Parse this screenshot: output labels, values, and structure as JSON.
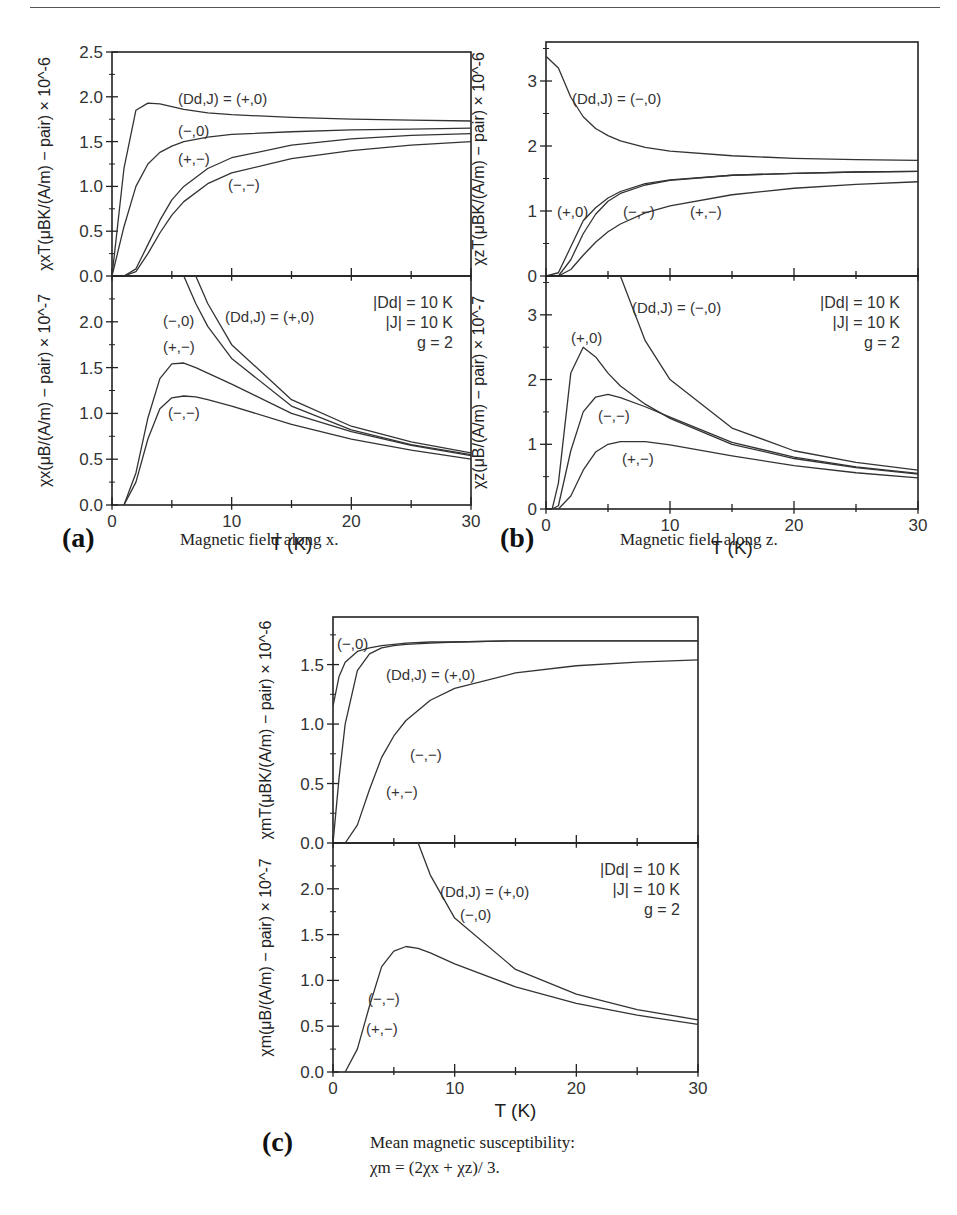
{
  "figure": {
    "panels": [
      {
        "id": "a",
        "label": "(a)",
        "caption": "Magnetic field along x."
      },
      {
        "id": "b",
        "label": "(b)",
        "caption": "Magnetic field along z."
      },
      {
        "id": "c",
        "label": "(c)",
        "caption": "Mean magnetic susceptibility:",
        "formula": "χm = (2χx + χz)/ 3."
      }
    ],
    "parameters": [
      "|Dd| = 10 K",
      "|J| = 10 K",
      "g = 2"
    ],
    "footer": "Fig. C.3 Magnetic susceptibility of a dimer..."
  },
  "chart_data": [
    {
      "type": "line",
      "panel": "a-top",
      "title": "",
      "xlabel": "T (K)",
      "ylabel": "χxT(μBK/(A/m) − pair) × 10^-6",
      "xlim": [
        0,
        30
      ],
      "ylim": [
        0,
        2.5
      ],
      "yticks": [
        0.0,
        0.5,
        1.0,
        1.5,
        2.0,
        2.5
      ],
      "x": [
        0,
        1,
        2,
        3,
        4,
        5,
        6,
        8,
        10,
        15,
        20,
        25,
        30
      ],
      "series": [
        {
          "name": "(Dd,J) = (+,0)",
          "values": [
            0,
            1.2,
            1.85,
            1.93,
            1.92,
            1.89,
            1.86,
            1.82,
            1.8,
            1.77,
            1.75,
            1.74,
            1.73
          ]
        },
        {
          "name": "(−,0)",
          "values": [
            0,
            0.55,
            1.0,
            1.25,
            1.38,
            1.45,
            1.5,
            1.55,
            1.58,
            1.61,
            1.63,
            1.64,
            1.65
          ]
        },
        {
          "name": "(+,−)",
          "values": [
            0,
            0.0,
            0.08,
            0.35,
            0.62,
            0.85,
            1.0,
            1.2,
            1.32,
            1.46,
            1.53,
            1.57,
            1.59
          ]
        },
        {
          "name": "(−,−)",
          "values": [
            0,
            0.0,
            0.05,
            0.25,
            0.48,
            0.68,
            0.83,
            1.03,
            1.15,
            1.31,
            1.4,
            1.46,
            1.5
          ]
        }
      ]
    },
    {
      "type": "line",
      "panel": "a-bottom",
      "title": "",
      "xlabel": "T (K)",
      "ylabel": "χx(μB/(A/m) − pair) × 10^-7",
      "xlim": [
        0,
        30
      ],
      "ylim": [
        0,
        2.5
      ],
      "xticks": [
        0,
        10,
        20,
        30
      ],
      "yticks": [
        0.0,
        0.5,
        1.0,
        1.5,
        2.0
      ],
      "x": [
        1,
        2,
        3,
        4,
        5,
        6,
        7,
        8,
        10,
        15,
        20,
        25,
        30
      ],
      "series": [
        {
          "name": "(Dd,J) = (+,0)",
          "values": [
            null,
            null,
            null,
            null,
            null,
            null,
            2.5,
            2.2,
            1.75,
            1.15,
            0.86,
            0.69,
            0.57
          ]
        },
        {
          "name": "(−,0)",
          "values": [
            null,
            null,
            null,
            null,
            null,
            2.5,
            2.2,
            1.95,
            1.6,
            1.08,
            0.82,
            0.66,
            0.55
          ]
        },
        {
          "name": "(+,−)",
          "values": [
            0,
            0.35,
            0.95,
            1.38,
            1.54,
            1.55,
            1.5,
            1.44,
            1.32,
            1.0,
            0.8,
            0.65,
            0.54
          ]
        },
        {
          "name": "(−,−)",
          "values": [
            0,
            0.25,
            0.72,
            1.05,
            1.17,
            1.19,
            1.18,
            1.15,
            1.08,
            0.88,
            0.72,
            0.6,
            0.5
          ]
        }
      ]
    },
    {
      "type": "line",
      "panel": "b-top",
      "title": "",
      "xlabel": "T (K)",
      "ylabel": "χzT(μBK/(A/m) − pair) × 10^-6",
      "xlim": [
        0,
        30
      ],
      "ylim": [
        0,
        3.6
      ],
      "yticks": [
        0,
        1,
        2,
        3
      ],
      "x": [
        0,
        1,
        2,
        3,
        4,
        5,
        6,
        8,
        10,
        15,
        20,
        25,
        30
      ],
      "series": [
        {
          "name": "(Dd,J) = (−,0)",
          "values": [
            3.38,
            3.2,
            2.75,
            2.45,
            2.27,
            2.16,
            2.08,
            1.98,
            1.92,
            1.85,
            1.81,
            1.79,
            1.78
          ]
        },
        {
          "name": "(+,0)",
          "values": [
            0,
            0.05,
            0.45,
            0.85,
            1.05,
            1.2,
            1.3,
            1.42,
            1.48,
            1.55,
            1.58,
            1.6,
            1.61
          ]
        },
        {
          "name": "(−,−)",
          "values": [
            0,
            0.0,
            0.25,
            0.65,
            0.95,
            1.15,
            1.27,
            1.4,
            1.47,
            1.55,
            1.58,
            1.6,
            1.61
          ]
        },
        {
          "name": "(+,−)",
          "values": [
            0,
            0.0,
            0.1,
            0.32,
            0.52,
            0.68,
            0.8,
            0.97,
            1.08,
            1.25,
            1.35,
            1.41,
            1.45
          ]
        }
      ]
    },
    {
      "type": "line",
      "panel": "b-bottom",
      "title": "",
      "xlabel": "T (K)",
      "ylabel": "χz(μB/(A/m) − pair) × 10^-7",
      "xlim": [
        0,
        30
      ],
      "ylim": [
        0,
        3.6
      ],
      "xticks": [
        0,
        10,
        20,
        30
      ],
      "yticks": [
        0,
        1,
        2,
        3
      ],
      "x": [
        0.5,
        1,
        2,
        3,
        4,
        5,
        6,
        8,
        10,
        15,
        20,
        25,
        30
      ],
      "series": [
        {
          "name": "(Dd,J) = (−,0)",
          "values": [
            null,
            null,
            null,
            null,
            null,
            null,
            3.6,
            2.6,
            2.0,
            1.25,
            0.9,
            0.72,
            0.6
          ]
        },
        {
          "name": "(+,0)",
          "values": [
            0,
            0.4,
            2.1,
            2.5,
            2.35,
            2.1,
            1.9,
            1.62,
            1.4,
            1.0,
            0.78,
            0.64,
            0.54
          ]
        },
        {
          "name": "(−,−)",
          "values": [
            0,
            0.05,
            0.9,
            1.5,
            1.73,
            1.77,
            1.72,
            1.58,
            1.42,
            1.03,
            0.8,
            0.65,
            0.55
          ]
        },
        {
          "name": "(+,−)",
          "values": [
            0,
            0.0,
            0.2,
            0.6,
            0.88,
            1.0,
            1.04,
            1.04,
            0.99,
            0.82,
            0.67,
            0.56,
            0.48
          ]
        }
      ]
    },
    {
      "type": "line",
      "panel": "c-top",
      "title": "",
      "xlabel": "T (K)",
      "ylabel": "χmT(μBK/(A/m) − pair) × 10^-6",
      "xlim": [
        0,
        30
      ],
      "ylim": [
        0,
        1.9
      ],
      "yticks": [
        0.0,
        0.5,
        1.0,
        1.5
      ],
      "x": [
        0,
        0.5,
        1,
        2,
        3,
        4,
        5,
        6,
        8,
        10,
        15,
        20,
        25,
        30
      ],
      "series": [
        {
          "name": "(−,0)",
          "values": [
            1.15,
            1.4,
            1.52,
            1.61,
            1.64,
            1.66,
            1.67,
            1.68,
            1.69,
            1.69,
            1.7,
            1.7,
            1.7,
            1.7
          ]
        },
        {
          "name": "(Dd,J) = (+,0)",
          "values": [
            0,
            0.55,
            1.0,
            1.45,
            1.59,
            1.64,
            1.66,
            1.67,
            1.68,
            1.69,
            1.7,
            1.7,
            1.7,
            1.7
          ]
        },
        {
          "name": "(−,−) / (+,−)",
          "values": [
            0,
            0,
            0.0,
            0.15,
            0.45,
            0.72,
            0.9,
            1.03,
            1.2,
            1.3,
            1.43,
            1.49,
            1.52,
            1.54
          ]
        }
      ]
    },
    {
      "type": "line",
      "panel": "c-bottom",
      "title": "",
      "xlabel": "T (K)",
      "ylabel": "χm(μB/(A/m) − pair) × 10^-7",
      "xlim": [
        0,
        30
      ],
      "ylim": [
        0,
        2.5
      ],
      "xticks": [
        0,
        10,
        20,
        30
      ],
      "yticks": [
        0.0,
        0.5,
        1.0,
        1.5,
        2.0
      ],
      "x": [
        1,
        2,
        3,
        4,
        5,
        6,
        7,
        8,
        10,
        15,
        20,
        25,
        30
      ],
      "series": [
        {
          "name": "(Dd,J) = (+,0) / (−,0)",
          "values": [
            null,
            null,
            null,
            null,
            null,
            null,
            2.5,
            2.15,
            1.68,
            1.12,
            0.85,
            0.68,
            0.57
          ]
        },
        {
          "name": "(−,−) / (+,−)",
          "values": [
            0,
            0.25,
            0.72,
            1.15,
            1.32,
            1.37,
            1.35,
            1.3,
            1.18,
            0.93,
            0.75,
            0.62,
            0.52
          ]
        }
      ]
    }
  ]
}
